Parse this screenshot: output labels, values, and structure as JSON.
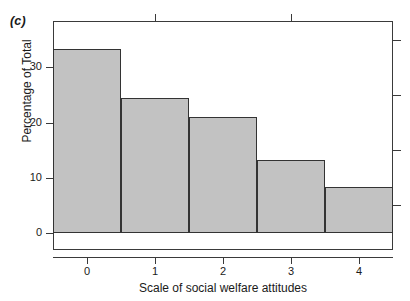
{
  "figure": {
    "panel_label": "(c)",
    "background_color": "#ffffff"
  },
  "chart_data": {
    "type": "bar",
    "title": "",
    "subtitle": "",
    "panel": "(c)",
    "categories": [
      "0",
      "1",
      "2",
      "3",
      "4"
    ],
    "values": [
      33.3,
      24.4,
      21.0,
      13.2,
      8.3
    ],
    "series": [
      {
        "name": "Percentage of Total",
        "values": [
          33.3,
          24.4,
          21.0,
          13.2,
          8.3
        ]
      }
    ],
    "xlabel": "Scale of social welfare attitudes",
    "ylabel": "Percentage of Total",
    "xtick_labels": [
      "0",
      "1",
      "2",
      "3",
      "4"
    ],
    "ytick_labels": [
      "0",
      "10",
      "20",
      "30"
    ],
    "ytick_values": [
      0,
      10,
      20,
      30
    ],
    "ylim": [
      0,
      38.4
    ],
    "xlim": [
      -0.5,
      4.5
    ],
    "grid": false,
    "legend": false,
    "legend_position": "none",
    "bar_fill_color": "#c2c2c2",
    "bar_edge_color": "#333333",
    "axis_color": "#3a3a3a",
    "bar_width_fraction": 1.0,
    "annotations": []
  },
  "axes": {
    "x_ticks": [
      {
        "label": "0",
        "value": 0
      },
      {
        "label": "1",
        "value": 1
      },
      {
        "label": "2",
        "value": 2
      },
      {
        "label": "3",
        "value": 3
      },
      {
        "label": "4",
        "value": 4
      }
    ],
    "y_ticks": [
      {
        "label": "0",
        "value": 0
      },
      {
        "label": "10",
        "value": 10
      },
      {
        "label": "20",
        "value": 20
      },
      {
        "label": "30",
        "value": 30
      }
    ]
  }
}
